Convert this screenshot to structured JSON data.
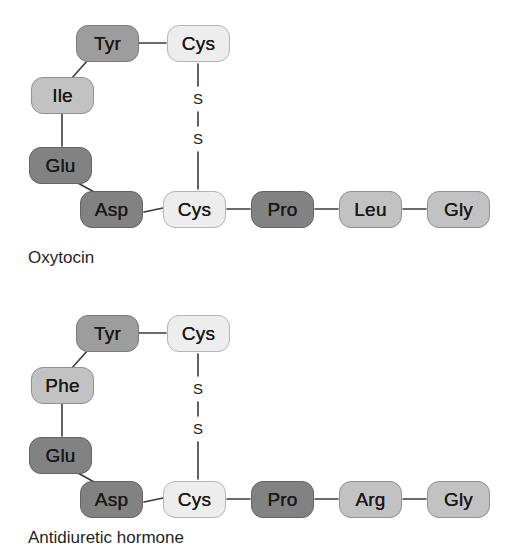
{
  "figure": {
    "type": "peptide-structure-diagram",
    "background_color": "#ffffff",
    "bond_color": "#3a3a3a",
    "shades": {
      "light": "#ededed",
      "mid": "#c2c2c2",
      "medium": "#9d9d9d",
      "dark": "#828282"
    }
  },
  "panels": [
    {
      "id": "oxytocin",
      "caption": "Oxytocin",
      "disulfide": {
        "top_sulfur": "S",
        "bottom_sulfur": "S"
      },
      "residues": [
        {
          "label": "Tyr",
          "shade": "medium",
          "x": 76,
          "y": 25
        },
        {
          "label": "Cys",
          "shade": "light",
          "x": 167,
          "y": 25
        },
        {
          "label": "Ile",
          "shade": "mid",
          "x": 31,
          "y": 77
        },
        {
          "label": "Glu",
          "shade": "dark",
          "x": 29,
          "y": 147
        },
        {
          "label": "Asp",
          "shade": "dark",
          "x": 80,
          "y": 191
        },
        {
          "label": "Cys",
          "shade": "light",
          "x": 163,
          "y": 191
        },
        {
          "label": "Pro",
          "shade": "dark",
          "x": 251,
          "y": 191
        },
        {
          "label": "Leu",
          "shade": "mid",
          "x": 339,
          "y": 191
        },
        {
          "label": "Gly",
          "shade": "mid",
          "x": 427,
          "y": 191
        }
      ]
    },
    {
      "id": "antidiuretic-hormone",
      "caption": "Antidiuretic hormone",
      "disulfide": {
        "top_sulfur": "S",
        "bottom_sulfur": "S"
      },
      "residues": [
        {
          "label": "Tyr",
          "shade": "medium",
          "x": 76,
          "y": 25
        },
        {
          "label": "Cys",
          "shade": "light",
          "x": 167,
          "y": 25
        },
        {
          "label": "Phe",
          "shade": "mid",
          "x": 31,
          "y": 77
        },
        {
          "label": "Glu",
          "shade": "dark",
          "x": 29,
          "y": 147
        },
        {
          "label": "Asp",
          "shade": "dark",
          "x": 80,
          "y": 191
        },
        {
          "label": "Cys",
          "shade": "light",
          "x": 163,
          "y": 191
        },
        {
          "label": "Pro",
          "shade": "dark",
          "x": 251,
          "y": 191
        },
        {
          "label": "Arg",
          "shade": "mid",
          "x": 339,
          "y": 191
        },
        {
          "label": "Gly",
          "shade": "mid",
          "x": 427,
          "y": 191
        }
      ]
    }
  ]
}
